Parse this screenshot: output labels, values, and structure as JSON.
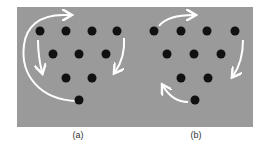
{
  "figure": {
    "panels": [
      {
        "id": "a",
        "caption": "(a)",
        "dots": [
          [
            40,
            31
          ],
          [
            66,
            31
          ],
          [
            92,
            31
          ],
          [
            117,
            31
          ],
          [
            53,
            54
          ],
          [
            79,
            54
          ],
          [
            106,
            54
          ],
          [
            66,
            78
          ],
          [
            92,
            78
          ],
          [
            79,
            100
          ]
        ],
        "arrows": [
          {
            "name": "outer-loop-arrow",
            "from": "bottom dot",
            "to": "top row",
            "direction": "counterclockwise-up"
          },
          {
            "name": "left-down-arrow",
            "direction": "down"
          },
          {
            "name": "right-down-arrow",
            "direction": "down"
          }
        ]
      },
      {
        "id": "b",
        "caption": "(b)",
        "dots": [
          [
            154,
            31
          ],
          [
            181,
            31
          ],
          [
            207,
            31
          ],
          [
            235,
            31
          ],
          [
            167,
            54
          ],
          [
            194,
            54
          ],
          [
            221,
            54
          ],
          [
            181,
            78
          ],
          [
            208,
            78
          ],
          [
            195,
            100
          ]
        ],
        "arrows": [
          {
            "name": "top-right-arrow",
            "direction": "right"
          },
          {
            "name": "right-down-arrow",
            "direction": "down"
          },
          {
            "name": "bottom-left-up-arrow",
            "direction": "up-left"
          }
        ]
      }
    ],
    "colors": {
      "background": "#9a9a9a",
      "dot": "#111111",
      "arrow": "#ffffff"
    }
  }
}
